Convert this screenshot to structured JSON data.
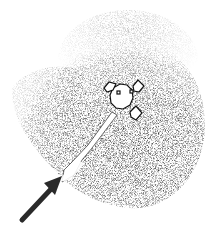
{
  "figure": {
    "colors": {
      "background": "#ffffff",
      "stipple": "#1a1a1a",
      "lander_fill": "#ffffff",
      "lander_outline": "#111111",
      "arrow": "#2a2a2a"
    },
    "elements": {
      "lander": "lander-icon",
      "streak": "bright-streak",
      "arrow": "arrow-indicator",
      "zone": "dark-surface-zone"
    }
  }
}
